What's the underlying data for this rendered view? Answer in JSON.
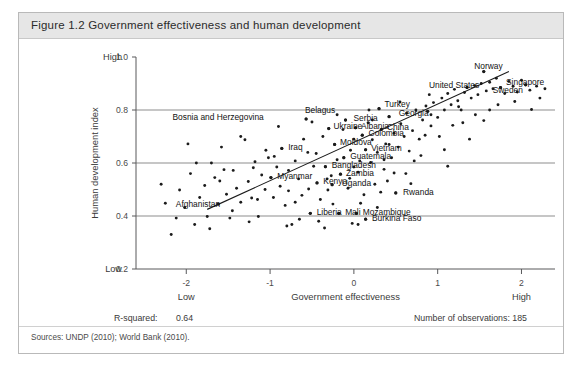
{
  "figure": {
    "title": "Figure 1.2  Government effectiveness and human development",
    "sources": "Sources: UNDP (2010); World Bank (2010).",
    "stats": {
      "rsquared_label": "R-squared:",
      "rsquared_value": "0.64",
      "observations": "Number of observations: 185"
    }
  },
  "chart_data": {
    "type": "scatter",
    "title": "Government effectiveness and human development",
    "xlabel": "Government effectiveness",
    "ylabel": "Human development index",
    "xlim": [
      -2.6,
      2.4
    ],
    "ylim": [
      0.2,
      1.0
    ],
    "xticks": [
      -2,
      -1,
      0,
      1,
      2
    ],
    "xtick_labels": [
      "-2",
      "-1",
      "0",
      "1",
      "2"
    ],
    "yticks": [
      0.2,
      0.4,
      0.6,
      0.8,
      1.0
    ],
    "ytick_labels": [
      "0.2",
      "0.4",
      "0.6",
      "0.8",
      "1.0"
    ],
    "x_low_label": "Low",
    "x_high_label": "High",
    "y_low_label": "Low",
    "y_high_label": "High",
    "gridlines_y": [
      0.4,
      0.6,
      0.8
    ],
    "grid": true,
    "legend": null,
    "rsquared": 0.64,
    "n_observations": 185,
    "trendline": {
      "type": "linear",
      "x0": -1.75,
      "y0": 0.425,
      "x1": 1.85,
      "y1": 0.945
    },
    "annotations": [
      {
        "label": "Norway",
        "x": 1.55,
        "y": 0.945,
        "lx": 1.4,
        "ly": 0.965
      },
      {
        "label": "Singapore",
        "x": 2.05,
        "y": 0.895,
        "lx": 1.78,
        "ly": 0.905
      },
      {
        "label": "Sweden",
        "x": 1.75,
        "y": 0.885,
        "lx": 1.62,
        "ly": 0.875
      },
      {
        "label": "United States",
        "x": 1.35,
        "y": 0.885,
        "lx": 0.86,
        "ly": 0.893
      },
      {
        "label": "Turkey",
        "x": 0.3,
        "y": 0.805,
        "lx": 0.33,
        "ly": 0.822
      },
      {
        "label": "Georgia",
        "x": 0.42,
        "y": 0.775,
        "lx": 0.5,
        "ly": 0.787
      },
      {
        "label": "Belagus",
        "x": 0.88,
        "y": 0.795,
        "lx": -0.62,
        "ly": 0.8
      },
      {
        "label": "Bosnia and Herzegovina",
        "x": -0.57,
        "y": 0.766,
        "lx": -2.2,
        "ly": 0.772
      },
      {
        "label": "Serbia",
        "x": -0.1,
        "y": 0.762,
        "lx": -0.04,
        "ly": 0.768
      },
      {
        "label": "Ukraine",
        "x": -0.3,
        "y": 0.73,
        "lx": -0.28,
        "ly": 0.74
      },
      {
        "label": "Albania",
        "x": 0.02,
        "y": 0.733,
        "lx": 0.05,
        "ly": 0.74
      },
      {
        "label": "China",
        "x": 0.33,
        "y": 0.727,
        "lx": 0.36,
        "ly": 0.735
      },
      {
        "label": "Colombia",
        "x": 0.1,
        "y": 0.705,
        "lx": 0.14,
        "ly": 0.712
      },
      {
        "label": "Moldova",
        "x": -0.23,
        "y": 0.67,
        "lx": -0.2,
        "ly": 0.678
      },
      {
        "label": "Vietnam",
        "x": 0.14,
        "y": 0.65,
        "lx": 0.17,
        "ly": 0.656
      },
      {
        "label": "Iraq",
        "x": -0.86,
        "y": 0.655,
        "lx": -0.82,
        "ly": 0.66
      },
      {
        "label": "Guatemala",
        "x": -0.12,
        "y": 0.62,
        "lx": -0.08,
        "ly": 0.627
      },
      {
        "label": "Bangladesh",
        "x": -0.34,
        "y": 0.586,
        "lx": -0.3,
        "ly": 0.592
      },
      {
        "label": "Zambia",
        "x": -0.16,
        "y": 0.558,
        "lx": -0.13,
        "ly": 0.564
      },
      {
        "label": "Myanmar",
        "x": -0.99,
        "y": 0.545,
        "lx": -0.95,
        "ly": 0.551
      },
      {
        "label": "Kenya",
        "x": -0.44,
        "y": 0.525,
        "lx": -0.4,
        "ly": 0.531
      },
      {
        "label": "Uganda",
        "x": -0.26,
        "y": 0.518,
        "lx": -0.18,
        "ly": 0.526
      },
      {
        "label": "Rwanda",
        "x": 0.5,
        "y": 0.487,
        "lx": 0.55,
        "ly": 0.492
      },
      {
        "label": "Afghanistan",
        "x": -1.62,
        "y": 0.445,
        "lx": -2.16,
        "ly": 0.447
      },
      {
        "label": "Liberia",
        "x": -0.52,
        "y": 0.41,
        "lx": -0.48,
        "ly": 0.415
      },
      {
        "label": "Mali",
        "x": -0.18,
        "y": 0.41,
        "lx": -0.14,
        "ly": 0.415
      },
      {
        "label": "Mozambique",
        "x": 0.03,
        "y": 0.41,
        "lx": 0.07,
        "ly": 0.416
      },
      {
        "label": "Burkina Faso",
        "x": 0.14,
        "y": 0.388,
        "lx": 0.18,
        "ly": 0.393
      }
    ],
    "points": [
      [
        -2.25,
        0.448
      ],
      [
        -2.18,
        0.33
      ],
      [
        -2.08,
        0.498
      ],
      [
        -2.02,
        0.432
      ],
      [
        -1.95,
        0.56
      ],
      [
        -1.9,
        0.368
      ],
      [
        -1.84,
        0.47
      ],
      [
        -1.78,
        0.515
      ],
      [
        -1.75,
        0.398
      ],
      [
        -1.7,
        0.6
      ],
      [
        -1.66,
        0.545
      ],
      [
        -1.62,
        0.445
      ],
      [
        -1.58,
        0.66
      ],
      [
        -1.52,
        0.482
      ],
      [
        -1.48,
        0.392
      ],
      [
        -1.44,
        0.572
      ],
      [
        -1.4,
        0.505
      ],
      [
        -1.35,
        0.452
      ],
      [
        -1.3,
        0.688
      ],
      [
        -1.26,
        0.53
      ],
      [
        -1.22,
        0.468
      ],
      [
        -1.18,
        0.605
      ],
      [
        -1.14,
        0.398
      ],
      [
        -1.1,
        0.555
      ],
      [
        -1.06,
        0.5
      ],
      [
        -1.02,
        0.62
      ],
      [
        -0.99,
        0.545
      ],
      [
        -0.96,
        0.47
      ],
      [
        -0.92,
        0.585
      ],
      [
        -0.88,
        0.512
      ],
      [
        -0.86,
        0.655
      ],
      [
        -0.82,
        0.44
      ],
      [
        -0.78,
        0.495
      ],
      [
        -0.74,
        0.368
      ],
      [
        -0.7,
        0.608
      ],
      [
        -0.66,
        0.54
      ],
      [
        -0.62,
        0.478
      ],
      [
        -0.57,
        0.766
      ],
      [
        -0.54,
        0.502
      ],
      [
        -0.52,
        0.41
      ],
      [
        -0.48,
        0.588
      ],
      [
        -0.45,
        0.636
      ],
      [
        -0.44,
        0.525
      ],
      [
        -0.4,
        0.462
      ],
      [
        -0.37,
        0.7
      ],
      [
        -0.34,
        0.586
      ],
      [
        -0.31,
        0.498
      ],
      [
        -0.3,
        0.73
      ],
      [
        -0.27,
        0.552
      ],
      [
        -0.26,
        0.518
      ],
      [
        -0.23,
        0.67
      ],
      [
        -0.2,
        0.612
      ],
      [
        -0.18,
        0.41
      ],
      [
        -0.16,
        0.558
      ],
      [
        -0.13,
        0.726
      ],
      [
        -0.12,
        0.62
      ],
      [
        -0.1,
        0.762
      ],
      [
        -0.07,
        0.505
      ],
      [
        -0.04,
        0.648
      ],
      [
        -0.02,
        0.372
      ],
      [
        0.0,
        0.69
      ],
      [
        0.02,
        0.733
      ],
      [
        0.03,
        0.41
      ],
      [
        0.05,
        0.565
      ],
      [
        0.07,
        0.608
      ],
      [
        0.1,
        0.705
      ],
      [
        0.12,
        0.48
      ],
      [
        0.14,
        0.65
      ],
      [
        0.14,
        0.388
      ],
      [
        0.17,
        0.752
      ],
      [
        0.2,
        0.602
      ],
      [
        0.22,
        0.688
      ],
      [
        0.25,
        0.52
      ],
      [
        0.28,
        0.64
      ],
      [
        0.3,
        0.805
      ],
      [
        0.33,
        0.727
      ],
      [
        0.36,
        0.576
      ],
      [
        0.38,
        0.672
      ],
      [
        0.42,
        0.775
      ],
      [
        0.45,
        0.62
      ],
      [
        0.48,
        0.712
      ],
      [
        0.5,
        0.487
      ],
      [
        0.53,
        0.66
      ],
      [
        0.56,
        0.748
      ],
      [
        0.6,
        0.7
      ],
      [
        0.63,
        0.788
      ],
      [
        0.66,
        0.645
      ],
      [
        0.7,
        0.722
      ],
      [
        0.74,
        0.8
      ],
      [
        0.78,
        0.69
      ],
      [
        0.82,
        0.762
      ],
      [
        0.86,
        0.815
      ],
      [
        0.88,
        0.795
      ],
      [
        0.92,
        0.74
      ],
      [
        0.95,
        0.828
      ],
      [
        1.0,
        0.772
      ],
      [
        1.05,
        0.845
      ],
      [
        1.08,
        0.8
      ],
      [
        1.12,
        0.862
      ],
      [
        1.16,
        0.82
      ],
      [
        1.2,
        0.878
      ],
      [
        1.24,
        0.835
      ],
      [
        1.28,
        0.8
      ],
      [
        1.32,
        0.866
      ],
      [
        1.35,
        0.885
      ],
      [
        1.4,
        0.845
      ],
      [
        1.44,
        0.892
      ],
      [
        1.48,
        0.858
      ],
      [
        1.52,
        0.9
      ],
      [
        1.55,
        0.945
      ],
      [
        1.58,
        0.872
      ],
      [
        1.62,
        0.905
      ],
      [
        1.66,
        0.88
      ],
      [
        1.7,
        0.92
      ],
      [
        1.75,
        0.885
      ],
      [
        1.8,
        0.862
      ],
      [
        1.85,
        0.908
      ],
      [
        1.9,
        0.89
      ],
      [
        1.95,
        0.868
      ],
      [
        2.0,
        0.912
      ],
      [
        2.05,
        0.895
      ],
      [
        2.1,
        0.875
      ],
      [
        2.18,
        0.89
      ],
      [
        2.22,
        0.845
      ],
      [
        2.28,
        0.88
      ],
      [
        -1.55,
        0.575
      ],
      [
        -1.05,
        0.648
      ],
      [
        -0.6,
        0.69
      ],
      [
        -0.25,
        0.445
      ],
      [
        0.08,
        0.448
      ],
      [
        0.4,
        0.532
      ],
      [
        0.72,
        0.608
      ],
      [
        1.02,
        0.7
      ],
      [
        1.3,
        0.752
      ],
      [
        1.62,
        0.8
      ],
      [
        -1.88,
        0.6
      ],
      [
        -1.35,
        0.7
      ],
      [
        -0.9,
        0.738
      ],
      [
        -0.5,
        0.755
      ],
      [
        0.18,
        0.8
      ],
      [
        0.55,
        0.83
      ],
      [
        0.9,
        0.858
      ],
      [
        1.18,
        0.742
      ],
      [
        1.45,
        0.782
      ],
      [
        1.72,
        0.82
      ],
      [
        -2.12,
        0.392
      ],
      [
        -1.72,
        0.352
      ],
      [
        -1.25,
        0.378
      ],
      [
        -0.8,
        0.362
      ],
      [
        -0.35,
        0.355
      ],
      [
        0.05,
        0.368
      ],
      [
        -0.65,
        0.388
      ],
      [
        -1.45,
        0.42
      ],
      [
        0.28,
        0.432
      ],
      [
        0.62,
        0.56
      ],
      [
        -0.05,
        0.542
      ],
      [
        0.32,
        0.49
      ],
      [
        0.68,
        0.522
      ],
      [
        1.08,
        0.65
      ],
      [
        1.38,
        0.69
      ],
      [
        -1.15,
        0.462
      ],
      [
        -0.7,
        0.452
      ],
      [
        -0.42,
        0.38
      ],
      [
        -0.55,
        0.64
      ],
      [
        -0.2,
        0.782
      ],
      [
        0.22,
        0.762
      ],
      [
        0.48,
        0.562
      ],
      [
        0.8,
        0.628
      ],
      [
        1.12,
        0.588
      ],
      [
        1.55,
        0.76
      ],
      [
        -2.3,
        0.52
      ],
      [
        -1.98,
        0.672
      ],
      [
        -1.6,
        0.532
      ],
      [
        -1.2,
        0.582
      ],
      [
        -0.95,
        0.625
      ],
      [
        0.42,
        0.67
      ],
      [
        0.85,
        0.705
      ],
      [
        1.25,
        0.812
      ],
      [
        1.92,
        0.832
      ],
      [
        2.12,
        0.802
      ],
      [
        -0.78,
        0.572
      ],
      [
        -0.32,
        0.54
      ],
      [
        0.0,
        0.585
      ],
      [
        0.36,
        0.612
      ],
      [
        0.92,
        0.782
      ]
    ]
  }
}
